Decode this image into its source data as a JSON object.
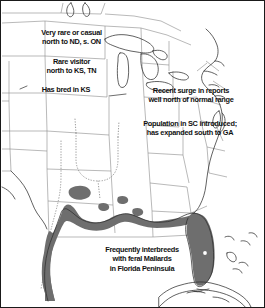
{
  "figure": {
    "type": "range-map",
    "frame_color": "#1a1a1a",
    "background_color": "#ffffff"
  },
  "legend_colors": {
    "range_fill": "#6e6e6e",
    "coastline": "#3a3a3a",
    "state_border": "#777777",
    "dotted_border": "#8c8c8c",
    "text": "#111111"
  },
  "annotations": [
    {
      "id": "very-rare-north",
      "lines": [
        "Very rare or casual",
        "north to ND, s. ON"
      ],
      "text": "Very rare or casual\nnorth to ND, s. ON",
      "leader": false
    },
    {
      "id": "rare-visitor",
      "lines": [
        "Rare visitor",
        "north to KS, TN"
      ],
      "text": "Rare visitor\nnorth to KS, TN",
      "leader": false
    },
    {
      "id": "has-bred-ks",
      "lines": [
        "Has bred in KS"
      ],
      "text": "Has bred in KS",
      "leader": true
    },
    {
      "id": "recent-surge",
      "lines": [
        "Recent surge in reports",
        "well north of normal range"
      ],
      "text": "Recent surge in reports\nwell north of normal range",
      "leader": true
    },
    {
      "id": "population-sc",
      "lines": [
        "Population in SC introduced;",
        "has expanded south to GA"
      ],
      "text": "Population in SC introduced;\nhas expanded south to GA",
      "leader": false
    },
    {
      "id": "interbreeds-florida",
      "lines": [
        "Frequently interbreeds",
        "with feral Mallards",
        "in Florida Peninsula"
      ],
      "text": "Frequently interbreeds\nwith feral Mallards\nin Florida Peninsula",
      "leader": false
    }
  ],
  "range_features": {
    "gulf_coast_band": "continuous shaded coastal band from south Texas east along the Gulf Coast to the Florida panhandle",
    "florida_peninsula": "solid shaded Florida peninsula with unshaded inland lake",
    "inland_patches": "three small isolated shaded patches in north Texas, Arkansas and Mississippi/Alabama"
  }
}
